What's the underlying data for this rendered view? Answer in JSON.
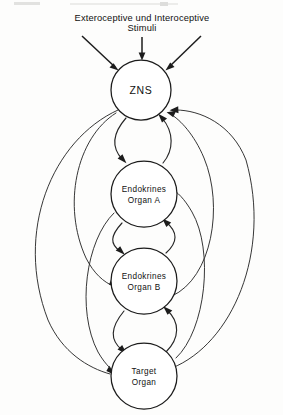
{
  "figure": {
    "title_lines": [
      "Exteroceptive und Interoceptive",
      "Stimuli"
    ],
    "title_line1": "Exteroceptive und Interoceptive",
    "title_line2": "Stimuli",
    "background_color": "#fdfdfc",
    "ink_color": "#1c1c1c",
    "width": 283,
    "height": 415
  },
  "top_edge_artifact": {
    "left_fragment": "",
    "right_fragment": ""
  },
  "nodes": [
    {
      "id": "zns",
      "label_line1": "ZNS",
      "label_line2": "",
      "cx": 141,
      "cy": 90,
      "r": 30
    },
    {
      "id": "endocrine-organ-a",
      "label_line1": "Endokrines",
      "label_line2": "Organ A",
      "cx": 144,
      "cy": 194,
      "r": 33
    },
    {
      "id": "endocrine-organ-b",
      "label_line1": "Endokrines",
      "label_line2": "Organ B",
      "cx": 144,
      "cy": 281,
      "r": 33
    },
    {
      "id": "target-organ",
      "label_line1": "Target",
      "label_line2": "Organ",
      "cx": 144,
      "cy": 376,
      "r": 33
    }
  ],
  "stimuli_arrows": [
    {
      "id": "stimulus-left",
      "direction": "down-right",
      "target": "zns"
    },
    {
      "id": "stimulus-center",
      "direction": "down",
      "target": "zns"
    },
    {
      "id": "stimulus-right",
      "direction": "down-left",
      "target": "zns"
    }
  ],
  "connections": [
    {
      "id": "zns-to-organ-a",
      "from": "zns",
      "to": "endocrine-organ-a",
      "kind": "short-curve",
      "side": "left",
      "arrow": true
    },
    {
      "id": "organ-a-to-zns",
      "from": "endocrine-organ-a",
      "to": "zns",
      "kind": "short-curve",
      "side": "right",
      "arrow": true
    },
    {
      "id": "organ-a-to-organ-b",
      "from": "endocrine-organ-a",
      "to": "endocrine-organ-b",
      "kind": "short-curve",
      "side": "left",
      "arrow": true
    },
    {
      "id": "organ-b-to-organ-a",
      "from": "endocrine-organ-b",
      "to": "endocrine-organ-a",
      "kind": "short-curve",
      "side": "right",
      "arrow": true
    },
    {
      "id": "organ-b-to-target",
      "from": "endocrine-organ-b",
      "to": "target-organ",
      "kind": "short-curve",
      "side": "left",
      "arrow": true
    },
    {
      "id": "target-to-organ-b",
      "from": "target-organ",
      "to": "endocrine-organ-b",
      "kind": "short-curve",
      "side": "right",
      "arrow": true
    },
    {
      "id": "zns-to-organ-b-long",
      "from": "zns",
      "to": "endocrine-organ-b",
      "kind": "long-arc",
      "side": "left",
      "arrow": true
    },
    {
      "id": "zns-to-target-long",
      "from": "zns",
      "to": "target-organ",
      "kind": "long-arc",
      "side": "left",
      "arrow": true
    },
    {
      "id": "organ-a-to-target-long",
      "from": "endocrine-organ-a",
      "to": "target-organ",
      "kind": "long-arc",
      "side": "left",
      "arrow": true
    },
    {
      "id": "organ-b-to-zns-long",
      "from": "endocrine-organ-b",
      "to": "zns",
      "kind": "long-arc",
      "side": "right",
      "arrow": true
    },
    {
      "id": "target-to-zns-long",
      "from": "target-organ",
      "to": "zns",
      "kind": "long-arc",
      "side": "right",
      "arrow": true
    },
    {
      "id": "target-to-organ-a-long",
      "from": "target-organ",
      "to": "endocrine-organ-a",
      "kind": "long-arc",
      "side": "right",
      "arrow": true
    }
  ]
}
